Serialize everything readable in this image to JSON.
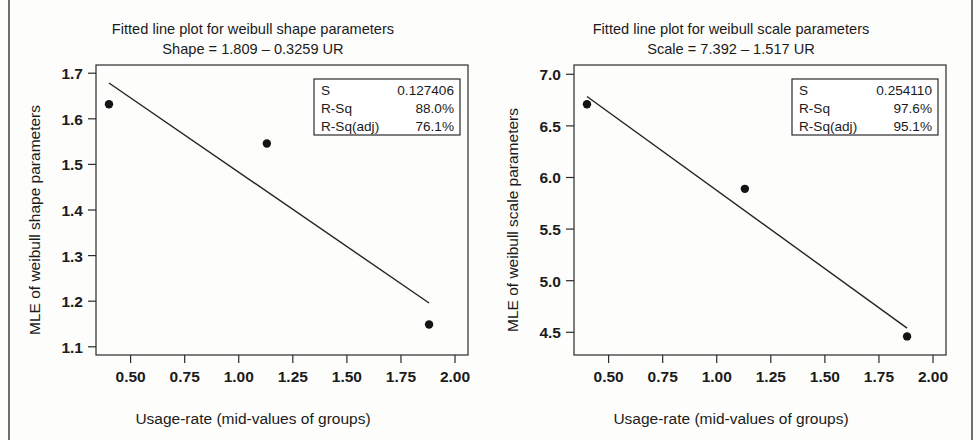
{
  "page": {
    "background_color": "#fdfdfc",
    "border_color": "#6e6e6e"
  },
  "chart_data": [
    {
      "id": "weibull-shape",
      "type": "scatter",
      "title": "Fitted line plot for weibull shape parameters",
      "subtitle": "Shape =  1.809 – 0.3259 UR",
      "equation": {
        "response": "Shape",
        "intercept": 1.809,
        "slope": -0.3259,
        "predictor": "UR",
        "text": "Shape =  1.809 – 0.3259 UR"
      },
      "xlabel": "Usage-rate (mid-values of groups)",
      "ylabel": "MLE of weibull shape parameters",
      "xlim": [
        0.34,
        2.06
      ],
      "ylim": [
        1.082,
        1.718
      ],
      "xticks": [
        0.5,
        0.75,
        1.0,
        1.25,
        1.5,
        1.75,
        2.0
      ],
      "xtick_labels": [
        "0.50",
        "0.75",
        "1.00",
        "1.25",
        "1.50",
        "1.75",
        "2.00"
      ],
      "yticks": [
        1.1,
        1.2,
        1.3,
        1.4,
        1.5,
        1.6,
        1.7
      ],
      "ytick_labels": [
        "1.1",
        "1.2",
        "1.3",
        "1.4",
        "1.5",
        "1.6",
        "1.7"
      ],
      "grid": false,
      "x": [
        0.4,
        1.13,
        1.88
      ],
      "y": [
        1.632,
        1.546,
        1.149
      ],
      "fit_line": {
        "x": [
          0.4,
          1.88
        ],
        "y": [
          1.6786,
          1.196
        ]
      },
      "legend_position": "top-right",
      "stats": [
        {
          "label": "S",
          "value": "0.127406"
        },
        {
          "label": "R-Sq",
          "value": "88.0%"
        },
        {
          "label": "R-Sq(adj)",
          "value": "76.1%"
        }
      ]
    },
    {
      "id": "weibull-scale",
      "type": "scatter",
      "title": "Fitted line plot for weibull scale parameters",
      "subtitle": "Scale =  7.392 – 1.517 UR",
      "equation": {
        "response": "Scale",
        "intercept": 7.392,
        "slope": -1.517,
        "predictor": "UR",
        "text": "Scale =  7.392 – 1.517 UR"
      },
      "xlabel": "Usage-rate (mid-values of groups)",
      "ylabel": "MLE of weibull scale parameters",
      "xlim": [
        0.34,
        2.06
      ],
      "ylim": [
        4.28,
        7.09
      ],
      "xticks": [
        0.5,
        0.75,
        1.0,
        1.25,
        1.5,
        1.75,
        2.0
      ],
      "xtick_labels": [
        "0.50",
        "0.75",
        "1.00",
        "1.25",
        "1.50",
        "1.75",
        "2.00"
      ],
      "yticks": [
        4.5,
        5.0,
        5.5,
        6.0,
        6.5,
        7.0
      ],
      "ytick_labels": [
        "4.5",
        "5.0",
        "5.5",
        "6.0",
        "6.5",
        "7.0"
      ],
      "grid": false,
      "x": [
        0.4,
        1.13,
        1.88
      ],
      "y": [
        6.71,
        5.89,
        4.46
      ],
      "fit_line": {
        "x": [
          0.4,
          1.88
        ],
        "y": [
          6.7852,
          4.5404
        ]
      },
      "legend_position": "top-right",
      "stats": [
        {
          "label": "S",
          "value": "0.254110"
        },
        {
          "label": "R-Sq",
          "value": "97.6%"
        },
        {
          "label": "R-Sq(adj)",
          "value": "95.1%"
        }
      ]
    }
  ]
}
